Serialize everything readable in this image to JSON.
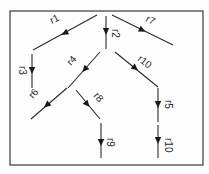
{
  "diagram": {
    "type": "directed-tree",
    "frame": {
      "x": 10,
      "y": 11,
      "width": 193,
      "height": 154
    },
    "edges": [
      {
        "id": "r1",
        "label": "r1",
        "x1": 97,
        "y1": 15,
        "x2": 33,
        "y2": 50,
        "ax": 65,
        "ay": 33,
        "lx": 52,
        "ly": 24,
        "rot": -28
      },
      {
        "id": "r2",
        "label": "r2",
        "x1": 106,
        "y1": 16,
        "x2": 106,
        "y2": 49,
        "ax": 106,
        "ay": 31,
        "lx": 112,
        "ly": 29,
        "rot": 90
      },
      {
        "id": "r7",
        "label": "r7",
        "x1": 112,
        "y1": 15,
        "x2": 173,
        "y2": 45,
        "ax": 142,
        "ay": 30,
        "lx": 145,
        "ly": 21,
        "rot": 28
      },
      {
        "id": "r3",
        "label": "r3",
        "x1": 32,
        "y1": 54,
        "x2": 32,
        "y2": 88,
        "ax": 32,
        "ay": 70,
        "lx": 19,
        "ly": 66,
        "rot": 90
      },
      {
        "id": "r4",
        "label": "r4",
        "x1": 100,
        "y1": 52,
        "x2": 68,
        "y2": 88,
        "ax": 85,
        "ay": 69,
        "lx": 71,
        "ly": 66,
        "rot": -48
      },
      {
        "id": "r10a",
        "label": "r10",
        "x1": 115,
        "y1": 52,
        "x2": 158,
        "y2": 87,
        "ax": 135,
        "ay": 68,
        "lx": 137,
        "ly": 60,
        "rot": 38
      },
      {
        "id": "r6",
        "label": "r6",
        "x1": 67,
        "y1": 88,
        "x2": 31,
        "y2": 119,
        "ax": 47,
        "ay": 105,
        "lx": 33,
        "ly": 99,
        "rot": -48
      },
      {
        "id": "r8",
        "label": "r8",
        "x1": 76,
        "y1": 90,
        "x2": 100,
        "y2": 119,
        "ax": 87,
        "ay": 104,
        "lx": 93,
        "ly": 96,
        "rot": 50
      },
      {
        "id": "r9",
        "label": "r9",
        "x1": 101,
        "y1": 123,
        "x2": 101,
        "y2": 158,
        "ax": 101,
        "ay": 142,
        "lx": 107,
        "ly": 138,
        "rot": 90
      },
      {
        "id": "r5",
        "label": "r5",
        "x1": 158,
        "y1": 88,
        "x2": 158,
        "y2": 122,
        "ax": 158,
        "ay": 104,
        "lx": 165,
        "ly": 100,
        "rot": 90
      },
      {
        "id": "r10b",
        "label": "r10",
        "x1": 158,
        "y1": 125,
        "x2": 158,
        "y2": 158,
        "ax": 158,
        "ay": 140,
        "lx": 165,
        "ly": 138,
        "rot": 90
      }
    ]
  }
}
